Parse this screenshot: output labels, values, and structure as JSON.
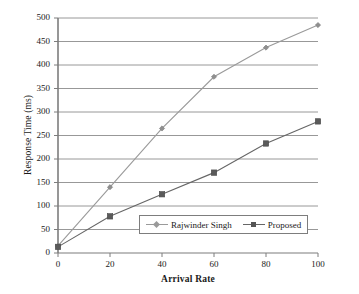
{
  "chart_data": {
    "type": "line",
    "title": "",
    "xlabel": "Arrival Rate",
    "ylabel": "Response Time (ms)",
    "x": [
      0,
      20,
      40,
      60,
      80,
      100
    ],
    "xlim": [
      0,
      100
    ],
    "ylim": [
      0,
      500
    ],
    "xticks": [
      "0",
      "20",
      "40",
      "60",
      "80",
      "100"
    ],
    "yticks": [
      "0",
      "50",
      "100",
      "150",
      "200",
      "250",
      "300",
      "350",
      "400",
      "450",
      "500"
    ],
    "grid": "horizontal",
    "legend_position": "inside-bottom-center",
    "series": [
      {
        "name": "Rajwinder Singh",
        "values": [
          15,
          140,
          265,
          375,
          437,
          485
        ],
        "color": "#9a9a9a",
        "marker": "diamond"
      },
      {
        "name": "Proposed",
        "values": [
          13,
          78,
          125,
          171,
          233,
          280
        ],
        "color": "#666666",
        "marker": "square"
      }
    ]
  },
  "axes": {
    "x_title": "Arrival Rate",
    "y_title": "Response Time (ms)"
  },
  "legend": {
    "entries": [
      {
        "label": "Rajwinder Singh"
      },
      {
        "label": "Proposed"
      }
    ]
  },
  "style": {
    "axis_color": "#7d7d7d",
    "grid_color": "#8c8c8c",
    "background": "#ffffff"
  }
}
